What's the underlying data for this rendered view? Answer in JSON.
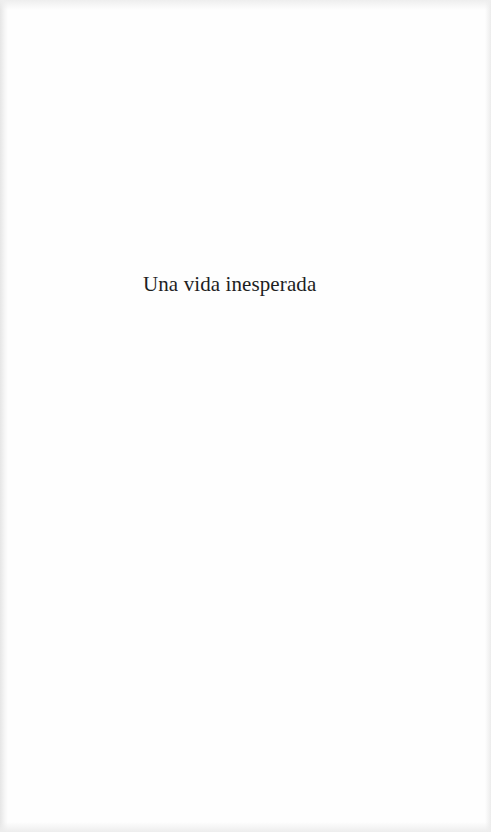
{
  "page": {
    "type": "half-title page",
    "title": "Una vida inesperada",
    "colors": {
      "paper": "#fefefe",
      "text": "#1f1f1f",
      "edge_shadow": "#e6e6e6"
    }
  }
}
